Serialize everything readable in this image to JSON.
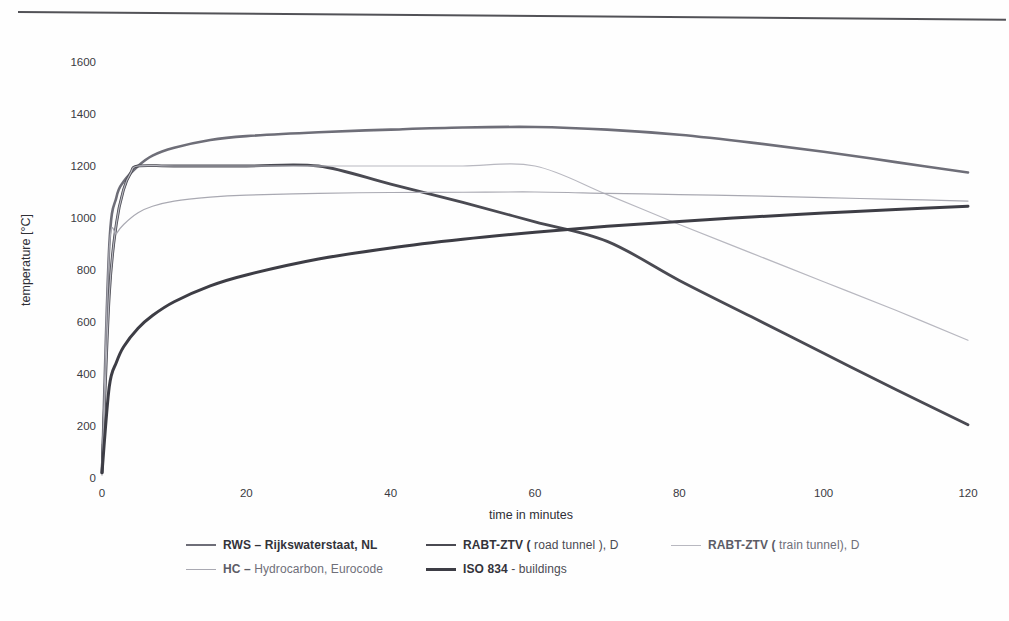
{
  "figure": {
    "top_rule": "horizontal-rule",
    "background_color": "#fefefe"
  },
  "axes": {
    "x_title": "time in minutes",
    "y_title": "temperature [°C]",
    "x_ticks": [
      "0",
      "20",
      "40",
      "60",
      "80",
      "100",
      "120"
    ],
    "y_ticks": [
      "0",
      "200",
      "400",
      "600",
      "800",
      "1000",
      "1200",
      "1400",
      "1600"
    ]
  },
  "legend": {
    "rows": [
      [
        {
          "label_strong": "RWS – Rijkswaterstaat, NL",
          "label_rest": "",
          "color": "#6e6e78",
          "width": 2.6,
          "dash": "none",
          "faint": false
        },
        {
          "label_strong": "RABT-ZTV (",
          "label_rest": " road tunnel ), D",
          "color": "#4a4a52",
          "width": 2.8,
          "dash": "none",
          "faint": false
        },
        {
          "label_strong": "RABT-ZTV (",
          "label_rest": " train tunnel), D",
          "color": "#b8b8c0",
          "width": 1.2,
          "dash": "none",
          "faint": true
        }
      ],
      [
        {
          "label_strong": "HC –",
          "label_rest": "  Hydrocarbon, Eurocode",
          "color": "#a9a9b2",
          "width": 1.2,
          "dash": "none",
          "faint": true
        },
        {
          "label_strong": "ISO 834",
          "label_rest": " - buildings",
          "color": "#3d3d45",
          "width": 3.0,
          "dash": "none",
          "faint": false
        }
      ]
    ]
  },
  "chart_data": {
    "type": "line",
    "title": "",
    "xlabel": "time in minutes",
    "ylabel": "temperature [°C]",
    "xlim": [
      0,
      120
    ],
    "ylim": [
      0,
      1700
    ],
    "grid": false,
    "legend_position": "below-axes",
    "x_ticks": [
      0,
      20,
      40,
      60,
      80,
      100,
      120
    ],
    "y_ticks": [
      0,
      200,
      400,
      600,
      800,
      1000,
      1200,
      1400,
      1600
    ],
    "series": [
      {
        "name": "RWS – Rijkswaterstaat, NL",
        "color": "#6e6e78",
        "stroke_width": 2.6,
        "x": [
          0,
          1,
          2,
          3,
          5,
          7,
          10,
          15,
          20,
          30,
          40,
          50,
          60,
          70,
          80,
          90,
          100,
          110,
          120
        ],
        "y": [
          20,
          890,
          1080,
          1140,
          1200,
          1240,
          1270,
          1300,
          1315,
          1330,
          1340,
          1348,
          1350,
          1340,
          1320,
          1290,
          1255,
          1215,
          1175
        ]
      },
      {
        "name": "RABT-ZTV ( road tunnel ), D",
        "color": "#4a4a52",
        "stroke_width": 2.8,
        "x": [
          0,
          1,
          2,
          3,
          4,
          5,
          10,
          20,
          30,
          40,
          50,
          60,
          70,
          80,
          90,
          100,
          110,
          120
        ],
        "y": [
          20,
          700,
          980,
          1110,
          1175,
          1200,
          1200,
          1200,
          1200,
          1130,
          1060,
          985,
          910,
          760,
          620,
          480,
          340,
          205
        ]
      },
      {
        "name": "RABT-ZTV ( train tunnel), D",
        "color": "#b8b8c0",
        "stroke_width": 1.2,
        "x": [
          0,
          1,
          2,
          3,
          4,
          5,
          10,
          20,
          30,
          40,
          50,
          60,
          70,
          80,
          90,
          100,
          110,
          120
        ],
        "y": [
          20,
          700,
          980,
          1110,
          1175,
          1200,
          1200,
          1200,
          1200,
          1200,
          1200,
          1200,
          1090,
          975,
          865,
          755,
          645,
          530
        ]
      },
      {
        "name": "HC –  Hydrocarbon, Eurocode",
        "color": "#a9a9b2",
        "stroke_width": 1.2,
        "x": [
          0,
          1,
          2,
          3,
          5,
          7,
          10,
          15,
          20,
          30,
          40,
          50,
          60,
          70,
          80,
          90,
          100,
          110,
          120
        ],
        "y": [
          20,
          880,
          940,
          975,
          1020,
          1045,
          1065,
          1080,
          1088,
          1095,
          1098,
          1099,
          1100,
          1095,
          1090,
          1085,
          1078,
          1072,
          1065
        ]
      },
      {
        "name": "ISO 834 - buildings",
        "color": "#3d3d45",
        "stroke_width": 3.0,
        "x": [
          0,
          1,
          2,
          3,
          5,
          7,
          10,
          15,
          20,
          30,
          40,
          50,
          60,
          70,
          80,
          90,
          100,
          110,
          120
        ],
        "y": [
          20,
          350,
          445,
          505,
          576,
          625,
          678,
          739,
          781,
          842,
          885,
          918,
          945,
          968,
          987,
          1004,
          1019,
          1033,
          1045
        ]
      }
    ],
    "annotations": []
  }
}
